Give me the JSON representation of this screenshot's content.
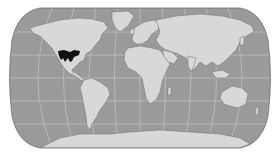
{
  "map": {
    "projection": "robinson",
    "style": "grayscale",
    "colors": {
      "background": "#ffffff",
      "ocean": "#9a9a9a",
      "land": "#d8d8d8",
      "land_edge": "#6e6e6e",
      "graticule": "#c9c9c9",
      "border": "#707070",
      "highlight": "#111111"
    },
    "highlighted_region": {
      "label": "species range",
      "location": "southwestern United States and northern Mexico"
    },
    "graticule": {
      "meridian_step_deg": 30,
      "parallel_step_deg": 30
    }
  }
}
